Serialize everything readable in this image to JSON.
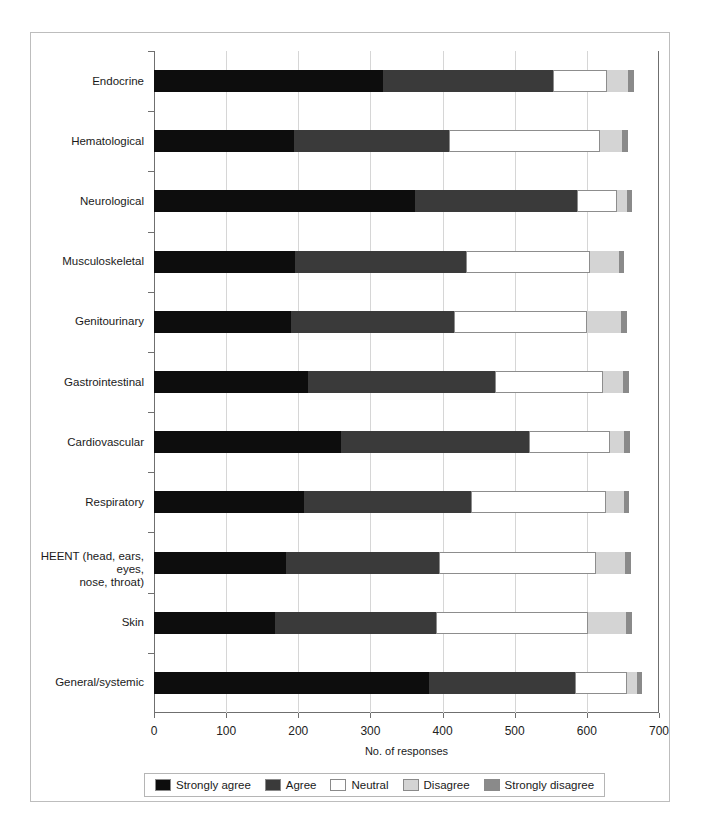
{
  "chart_data": {
    "type": "bar",
    "orientation": "horizontal",
    "stacked": true,
    "title": "",
    "xlabel": "No. of responses",
    "ylabel": "",
    "xlim": [
      0,
      700
    ],
    "ylim": null,
    "grid": "vertical",
    "legend_position": "bottom",
    "xticks": [
      0,
      100,
      200,
      300,
      400,
      500,
      600,
      700
    ],
    "xtick_labels": [
      "0",
      "100",
      "200",
      "300",
      "400",
      "500",
      "600",
      "700"
    ],
    "categories": [
      "Endocrine",
      "Hematological",
      "Neurological",
      "Musculoskeletal",
      "Genitourinary",
      "Gastrointestinal",
      "Cardiovascular",
      "Respiratory",
      "HEENT (head, ears, eyes,\nnose, throat)",
      "Skin",
      "General/systemic"
    ],
    "series": [
      {
        "name": "Strongly agree",
        "color": "#0d0d0d",
        "values": [
          317,
          194,
          362,
          195,
          190,
          213,
          259,
          208,
          183,
          168,
          381
        ]
      },
      {
        "name": "Agree",
        "color": "#3a3a3a",
        "values": [
          236,
          215,
          224,
          237,
          226,
          259,
          261,
          231,
          212,
          223,
          203
        ]
      },
      {
        "name": "Neutral",
        "color": "#ffffff",
        "values": [
          75,
          209,
          56,
          173,
          184,
          151,
          112,
          187,
          217,
          210,
          72
        ]
      },
      {
        "name": "Disagree",
        "color": "#d4d4d4",
        "values": [
          29,
          31,
          13,
          39,
          47,
          27,
          20,
          25,
          41,
          53,
          13
        ]
      },
      {
        "name": "Strongly disagree",
        "color": "#8a8a8a",
        "values": [
          8,
          8,
          8,
          8,
          8,
          8,
          8,
          8,
          8,
          8,
          8
        ]
      }
    ],
    "legend_entries": [
      {
        "label": "Strongly agree",
        "color": "#0d0d0d"
      },
      {
        "label": "Agree",
        "color": "#3a3a3a"
      },
      {
        "label": "Neutral",
        "color": "#ffffff"
      },
      {
        "label": "Disagree",
        "color": "#d4d4d4"
      },
      {
        "label": "Strongly disagree",
        "color": "#8a8a8a"
      }
    ]
  }
}
